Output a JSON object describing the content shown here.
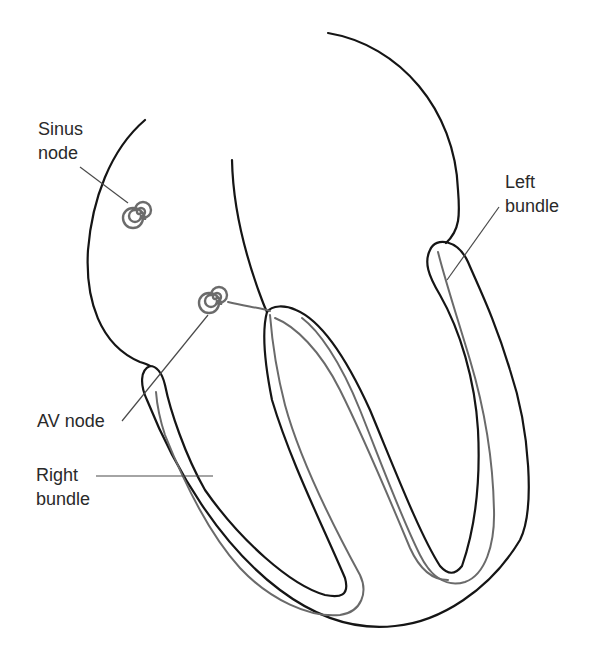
{
  "diagram": {
    "labels": {
      "sinus_node": "Sinus\nnode",
      "av_node": "AV node",
      "left_bundle": "Left\nbundle",
      "right_bundle": "Right\nbundle"
    },
    "colors": {
      "outline": "#151515",
      "conduction_path": "#6a6a6a",
      "node": "#6b6b6b",
      "label_text": "#2a2a2a",
      "background": "#ffffff"
    }
  }
}
